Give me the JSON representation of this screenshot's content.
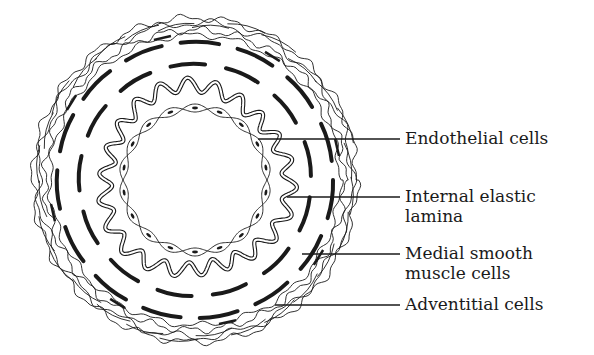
{
  "diagram": {
    "center": [
      195,
      180
    ],
    "colors": {
      "background": "#ffffff",
      "ink": "#1a1a1a"
    },
    "layers": {
      "lumen_radius": 68,
      "endothelium_radius": 76,
      "elastic_lamina_radius": 92,
      "media_inner_radius": 116,
      "media_outer_radius": 138,
      "adventitia_inner_radius": 148,
      "adventitia_outer_radius": 162
    }
  },
  "labels": [
    {
      "id": "endothelial",
      "text": "Endothelial cells",
      "top": 128,
      "line_y": 139,
      "line_x1": 258
    },
    {
      "id": "internal-elastic-lamina",
      "text": "Internal elastic\nlamina",
      "top": 186,
      "line_y": 197,
      "line_x1": 287
    },
    {
      "id": "medial-smooth-muscle",
      "text": "Medial smooth\nmuscle cells",
      "top": 243,
      "line_y": 254,
      "line_x1": 302
    },
    {
      "id": "adventitial",
      "text": "Adventitial cells",
      "top": 294,
      "line_y": 305,
      "line_x1": 275
    }
  ],
  "leader_line_end_x": 400
}
